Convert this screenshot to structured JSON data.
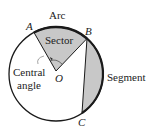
{
  "diagram": {
    "labels": {
      "arc": "Arc",
      "sector": "Sector",
      "segment": "Segment",
      "central_angle_line1": "Central",
      "central_angle_line2": "angle"
    },
    "points": {
      "A": "A",
      "B": "B",
      "C": "C",
      "O": "O"
    },
    "colors": {
      "fill": "#c8c8c8",
      "stroke": "#1a1a1a",
      "background": "#ffffff"
    }
  }
}
